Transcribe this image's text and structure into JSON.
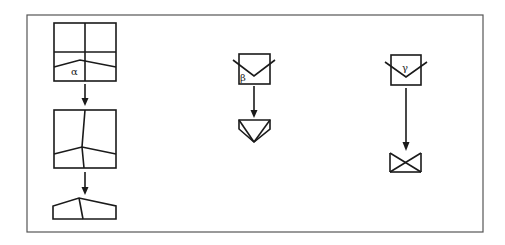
{
  "diagram": {
    "type": "grain-evolution schematic",
    "columns": [
      {
        "id": "alpha",
        "label": "α",
        "stages": [
          "initial-grain-grid",
          "intermediate-grain-shape",
          "final-truncated-shape"
        ],
        "arrows": 2
      },
      {
        "id": "beta",
        "label": "β",
        "stages": [
          "initial-v-notched-box",
          "final-inverted-triangle-shape"
        ],
        "arrows": 1
      },
      {
        "id": "gamma",
        "label": "γ",
        "stages": [
          "initial-v-notched-box",
          "final-bowtie-shape"
        ],
        "arrows": 1
      }
    ]
  }
}
